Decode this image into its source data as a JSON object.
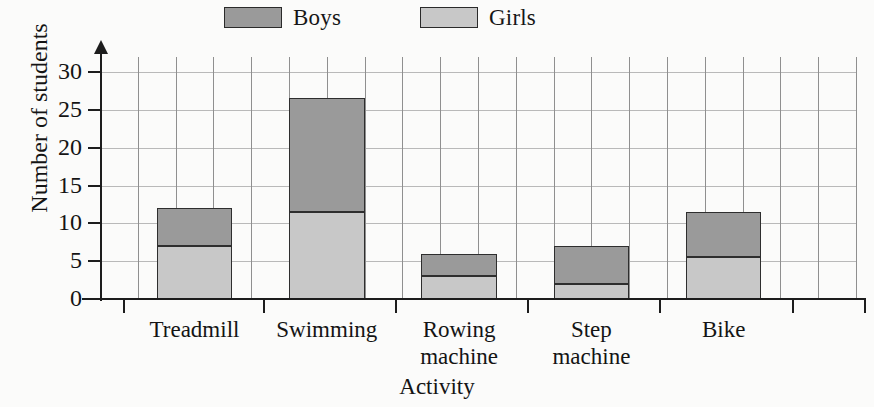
{
  "chart_data": {
    "type": "bar",
    "subtype": "stacked-vertical",
    "title": "",
    "xlabel": "Activity",
    "ylabel": "Number of students",
    "categories": [
      "Treadmill",
      "Swimming",
      "Rowing machine",
      "Step machine",
      "Bike"
    ],
    "category_labels": [
      [
        "Treadmill"
      ],
      [
        "Swimming"
      ],
      [
        "Rowing",
        "machine"
      ],
      [
        "Step",
        "machine"
      ],
      [
        "Bike"
      ]
    ],
    "series": [
      {
        "name": "Girls",
        "color": "#c8c8c8",
        "values": [
          7,
          11.5,
          3,
          2,
          5.5
        ]
      },
      {
        "name": "Boys",
        "color": "#9a9a9a",
        "values": [
          5,
          15,
          3,
          5,
          6
        ]
      }
    ],
    "totals": [
      12,
      26.5,
      6,
      7,
      11.5
    ],
    "stack_order": [
      "Girls",
      "Boys"
    ],
    "ylim": [
      0,
      32
    ],
    "yticks": [
      0,
      5,
      10,
      15,
      20,
      25,
      30
    ],
    "ytick_labels": [
      "0",
      "5",
      "10",
      "15",
      "20",
      "25",
      "30"
    ],
    "grid": {
      "horizontal": true,
      "vertical": true
    },
    "legend": {
      "position": "top",
      "entries": [
        {
          "label": "Boys",
          "color": "#9a9a9a"
        },
        {
          "label": "Girls",
          "color": "#c8c8c8"
        }
      ]
    },
    "colors": {
      "boys": "#9a9a9a",
      "girls": "#c8c8c8",
      "bar_outline": "#2e2e2e",
      "axis": "#1d1d1d",
      "gridline_horizontal": "#b9b9b9",
      "gridline_vertical": "#8f8f8f",
      "background": "#fbfbfa",
      "text": "#141414"
    }
  }
}
